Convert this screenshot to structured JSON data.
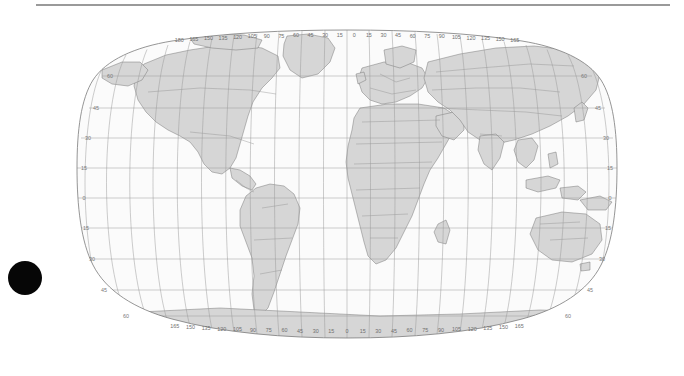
{
  "page": {
    "background_color": "#ffffff",
    "rule_color": "#9a9a9a",
    "marker_color": "#060606",
    "marker_name": "black-dot-marker"
  },
  "map": {
    "title": "",
    "projection": "Robinson",
    "ocean_color": "#fbfbfb",
    "land_color": "#d6d6d6",
    "border_color": "#8c8c8c",
    "coast_color": "#6e6e6e",
    "graticule_color": "#9b9b9b",
    "outline_color": "#7b7b7b",
    "graticule_spacing_lon": 15,
    "graticule_spacing_lat": 15,
    "lon_range": [
      -180,
      180
    ],
    "lat_range": [
      -90,
      90
    ],
    "top_axis_labels": [
      "180",
      "165",
      "150",
      "135",
      "120",
      "105",
      "90",
      "75",
      "60",
      "45",
      "30",
      "15",
      "0",
      "15",
      "30",
      "45",
      "60",
      "75",
      "90",
      "105",
      "120",
      "135",
      "150",
      "165"
    ],
    "bottom_axis_labels": [
      "165",
      "150",
      "135",
      "120",
      "105",
      "90",
      "75",
      "60",
      "45",
      "30",
      "15",
      "0",
      "15",
      "30",
      "45",
      "60",
      "75",
      "90",
      "105",
      "120",
      "135",
      "150",
      "165"
    ],
    "left_axis_labels": [
      "60",
      "45",
      "30",
      "15",
      "0",
      "15",
      "30",
      "45",
      "60"
    ],
    "right_axis_labels": [
      "60",
      "45",
      "30",
      "15",
      "0",
      "15",
      "30",
      "45",
      "60"
    ]
  },
  "chart_data": {
    "type": "map",
    "title": "",
    "xlabel": "",
    "ylabel": "",
    "projection": "Robinson",
    "grid": true,
    "legend": "none",
    "xlim": [
      -180,
      180
    ],
    "ylim": [
      -90,
      90
    ],
    "lon_ticks": [
      -180,
      -165,
      -150,
      -135,
      -120,
      -105,
      -90,
      -75,
      -60,
      -45,
      -30,
      -15,
      0,
      15,
      30,
      45,
      60,
      75,
      90,
      105,
      120,
      135,
      150,
      165,
      180
    ],
    "lat_ticks": [
      -60,
      -45,
      -30,
      -15,
      0,
      15,
      30,
      45,
      60
    ],
    "lon_tick_labels": [
      "180",
      "165",
      "150",
      "135",
      "120",
      "105",
      "90",
      "75",
      "60",
      "45",
      "30",
      "15",
      "0",
      "15",
      "30",
      "45",
      "60",
      "75",
      "90",
      "105",
      "120",
      "135",
      "150",
      "165",
      "180"
    ],
    "lat_tick_labels": [
      "60",
      "45",
      "30",
      "15",
      "0",
      "15",
      "30",
      "45",
      "60"
    ],
    "series": [
      {
        "name": "land",
        "fill": "#d6d6d6",
        "stroke": "#6e6e6e"
      },
      {
        "name": "country-borders",
        "fill": "none",
        "stroke": "#8c8c8c"
      },
      {
        "name": "graticule",
        "fill": "none",
        "stroke": "#9b9b9b"
      }
    ],
    "annotations": [
      {
        "name": "black-dot-marker",
        "shape": "filled-circle",
        "x_px": 25,
        "y_px": 278,
        "radius_px": 17,
        "color": "#060606"
      },
      {
        "name": "top-rule",
        "shape": "horizontal-line",
        "x_px": 36,
        "y_px": 5,
        "width_px": 634,
        "color": "#9a9a9a"
      }
    ]
  }
}
